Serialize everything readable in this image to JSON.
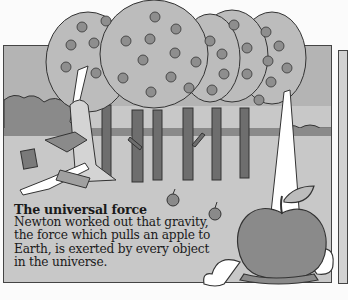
{
  "illustration": {
    "subject": "Newton sitting under apple trees while an apple falls to the ground",
    "palette": {
      "sky": "#b4b4b4",
      "hedge": "#8a8a8a",
      "ground": "#c8c8c8",
      "foliage": "#bcbcbc",
      "fruit": "#8e8e8e",
      "trunk": "#6e6e6e",
      "apple": "#8a8a8a",
      "outline": "#333333"
    }
  },
  "caption": {
    "title": "The universal force",
    "body": "Newton worked out that gravity, the force which pulls an apple to Earth, is exerted by every object in the universe."
  }
}
